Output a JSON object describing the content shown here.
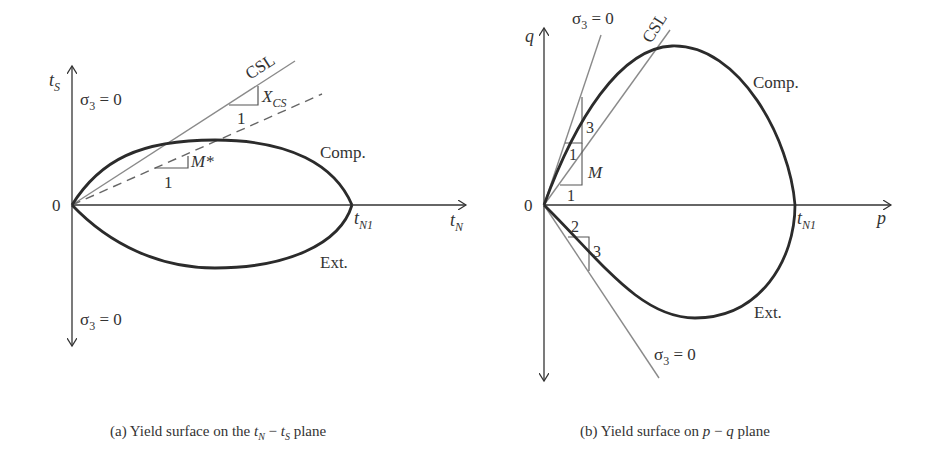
{
  "panel_a": {
    "y_axis_label": "t",
    "y_axis_sub": "S",
    "x_axis_label": "t",
    "x_axis_sub": "N",
    "origin_label": "0",
    "tn1_label": "t",
    "tn1_sub": "N1",
    "sigma_top": "σ",
    "sigma_top_sub": "3",
    "sigma_top_rest": " = 0",
    "sigma_bottom": "σ",
    "sigma_bottom_sub": "3",
    "sigma_bottom_rest": " = 0",
    "csl_label": "CSL",
    "xcs_label": "X",
    "xcs_sub": "CS",
    "xcs_one": "1",
    "mstar_label": "M*",
    "mstar_one": "1",
    "comp_label": "Comp.",
    "ext_label": "Ext.",
    "caption_prefix": "(a) Yield surface on the ",
    "caption_t1": "t",
    "caption_t1_sub": "N",
    "caption_mid": " − ",
    "caption_t2": "t",
    "caption_t2_sub": "S",
    "caption_suffix": " plane"
  },
  "panel_b": {
    "y_axis_label": "q",
    "x_axis_label": "p",
    "origin_label": "0",
    "tn1_label": "t",
    "tn1_sub": "N1",
    "sigma_top": "σ",
    "sigma_top_sub": "3",
    "sigma_top_rest": " = 0",
    "sigma_bottom": "σ",
    "sigma_bottom_sub": "3",
    "sigma_bottom_rest": " = 0",
    "csl_label": "CSL",
    "slope3_label": "3",
    "slope1_label": "1",
    "m_label": "M",
    "m_one": "1",
    "ext_two": "2",
    "ext_three": "3",
    "comp_label": "Comp.",
    "ext_label": "Ext.",
    "caption_prefix": "(b) Yield surface on ",
    "caption_p": "p",
    "caption_mid": " − ",
    "caption_q": "q",
    "caption_suffix": " plane"
  },
  "colors": {
    "curve": "#2b2b2b",
    "axis": "#333333",
    "guide": "#8a8a8a"
  }
}
